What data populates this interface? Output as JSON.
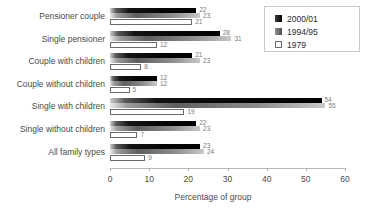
{
  "title_strip": "",
  "legend": {
    "position": "top-right",
    "entries": [
      {
        "label": "2000/01",
        "swatch": "black-square-icon"
      },
      {
        "label": "1994/95",
        "swatch": "grey-square-icon"
      },
      {
        "label": "1979",
        "swatch": "white-square-icon"
      }
    ]
  },
  "axis": {
    "x_title": "Percentage of group",
    "ticks": [
      "0",
      "10",
      "20",
      "30",
      "40",
      "50",
      "60"
    ]
  },
  "chart_data": {
    "type": "bar",
    "orientation": "horizontal",
    "title": "",
    "xlabel": "Percentage of group",
    "ylabel": "",
    "xlim": [
      0,
      60
    ],
    "grid": false,
    "legend_position": "top-right",
    "categories": [
      "Pensioner couple",
      "Single pensioner",
      "Couple with children",
      "Couple without children",
      "Single with children",
      "Single without children",
      "All family types"
    ],
    "series": [
      {
        "name": "2000/01",
        "values": [
          22,
          28,
          21,
          12,
          54,
          22,
          23
        ]
      },
      {
        "name": "1994/95",
        "values": [
          23,
          31,
          23,
          12,
          55,
          23,
          24
        ]
      },
      {
        "name": "1979",
        "values": [
          21,
          12,
          8,
          5,
          19,
          7,
          9
        ]
      }
    ],
    "data_labels": {
      "Pensioner couple": [
        "22",
        "23",
        "21"
      ],
      "Single pensioner": [
        "28",
        "31",
        "12"
      ],
      "Couple with children": [
        "21",
        "23",
        "8"
      ],
      "Couple without children": [
        "12",
        "12",
        "5"
      ],
      "Single with children": [
        "54",
        "55",
        "19"
      ],
      "Single without children": [
        "22",
        "23",
        "7"
      ],
      "All family types": [
        "23",
        "24",
        "9"
      ]
    }
  }
}
